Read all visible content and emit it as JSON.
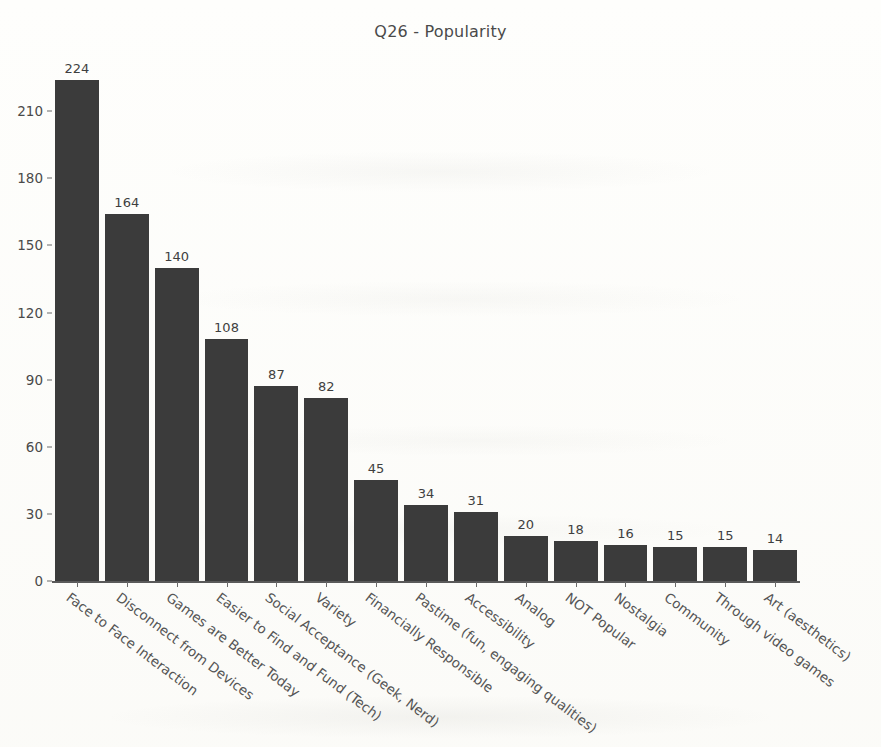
{
  "chart_data": {
    "type": "bar",
    "title": "Q26 - Popularity",
    "xlabel": "",
    "ylabel": "",
    "ylim": [
      0,
      224
    ],
    "yticks": [
      0,
      30,
      60,
      90,
      120,
      150,
      180,
      210
    ],
    "grid": false,
    "legend": null,
    "bar_color": "#3b3b3b",
    "categories": [
      "Face to Face Interaction",
      "Disconnect from Devices",
      "Games are Better Today",
      "Easier to Find and Fund (Tech)",
      "Social Acceptance (Geek, Nerd)",
      "Variety",
      "Financially Responsible",
      "Pastime (fun, engaging qualities)",
      "Accessibility",
      "Analog",
      "NOT Popular",
      "Nostalgia",
      "Community",
      "Through video games",
      "Art (aesthetics)"
    ],
    "values": [
      224,
      164,
      140,
      108,
      87,
      82,
      45,
      34,
      31,
      20,
      18,
      16,
      15,
      15,
      14
    ]
  }
}
